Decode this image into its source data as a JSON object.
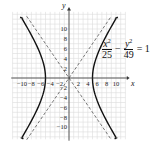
{
  "chart_data": {
    "type": "line",
    "title": "",
    "xlabel": "x",
    "ylabel": "y",
    "xlim": [
      -12,
      12
    ],
    "ylim": [
      -12,
      12
    ],
    "grid": true,
    "x_ticks": [
      -10,
      -8,
      -6,
      -4,
      -2,
      2,
      4,
      6,
      8,
      10
    ],
    "y_ticks": [
      -10,
      -8,
      -6,
      -4,
      -2,
      2,
      4,
      6,
      8,
      10
    ],
    "x_tick_labels": [
      "−10",
      "−8",
      "−6",
      "−4",
      "−2",
      "2",
      "4",
      "6",
      "8",
      "10"
    ],
    "y_tick_labels": [
      "−10",
      "−8",
      "−6",
      "−4",
      "−2",
      "2",
      "4",
      "6",
      "8",
      "10"
    ],
    "series": [
      {
        "name": "hyperbola",
        "equation": "x^2/25 - y^2/49 = 1",
        "a": 5,
        "b": 7,
        "style": "solid",
        "color": "#111111"
      },
      {
        "name": "asymptote y = 7x/5",
        "slope": 1.4,
        "style": "dashed",
        "color": "#555555"
      },
      {
        "name": "asymptote y = -7x/5",
        "slope": -1.4,
        "style": "dashed",
        "color": "#555555"
      }
    ],
    "annotations": [
      {
        "text": "x²/25 − y²/49 = 1",
        "position": "upper right"
      }
    ]
  },
  "equation": {
    "num1": "x",
    "den1": "25",
    "op": "−",
    "num2": "y",
    "den2": "49",
    "rhs": "= 1",
    "exp": "2"
  },
  "axes": {
    "x_label": "x",
    "y_label": "y"
  }
}
